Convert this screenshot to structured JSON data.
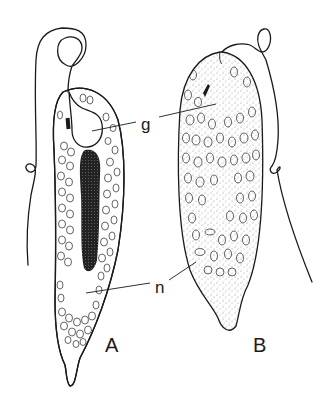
{
  "figure": {
    "background": "#ffffff",
    "ink_color": "#1a1a1a",
    "panels": [
      {
        "id": "A",
        "label": "A",
        "description": "Cell with dense dark central granule streak, large clear vacuole at top and clear region at posterior"
      },
      {
        "id": "B",
        "label": "B",
        "description": "Cell with stippled cytoplasm full of oval granules containing inner structures"
      }
    ],
    "annotations": {
      "g": "g",
      "n": "n"
    }
  }
}
